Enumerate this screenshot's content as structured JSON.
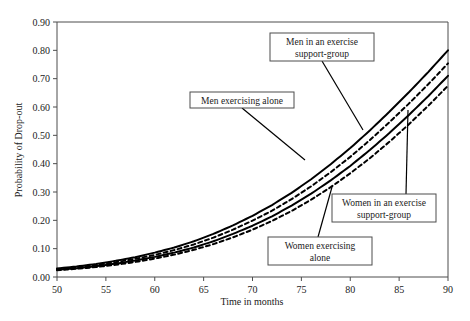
{
  "chart_data": {
    "type": "line",
    "title": "",
    "xlabel": "Time in months",
    "ylabel": "Probability of Drop-out",
    "xlim": [
      50,
      90
    ],
    "ylim": [
      0.0,
      0.9
    ],
    "xticks": [
      "50",
      "55",
      "60",
      "65",
      "70",
      "75",
      "80",
      "85",
      "90"
    ],
    "xtick_values": [
      50,
      55,
      60,
      65,
      70,
      75,
      80,
      85,
      90
    ],
    "yticks": [
      "0.00",
      "0.10",
      "0.20",
      "0.30",
      "0.40",
      "0.50",
      "0.60",
      "0.70",
      "0.80",
      "0.90"
    ],
    "ytick_values": [
      0.0,
      0.1,
      0.2,
      0.3,
      0.4,
      0.5,
      0.6,
      0.7,
      0.8,
      0.9
    ],
    "grid": false,
    "legend": "annotated-callouts",
    "x": [
      50,
      52,
      54,
      56,
      58,
      60,
      62,
      64,
      66,
      68,
      70,
      72,
      74,
      76,
      78,
      80,
      82,
      84,
      86,
      88,
      90
    ],
    "series": [
      {
        "name": "Men in an exercise support-group",
        "style": "solid",
        "color": "#000000",
        "values": [
          0.03,
          0.037,
          0.046,
          0.057,
          0.07,
          0.086,
          0.104,
          0.126,
          0.152,
          0.182,
          0.216,
          0.254,
          0.297,
          0.345,
          0.398,
          0.455,
          0.517,
          0.583,
          0.652,
          0.724,
          0.8
        ]
      },
      {
        "name": "Men exercising alone",
        "style": "dashed",
        "color": "#000000",
        "values": [
          0.028,
          0.034,
          0.042,
          0.052,
          0.064,
          0.078,
          0.095,
          0.115,
          0.139,
          0.167,
          0.199,
          0.234,
          0.275,
          0.32,
          0.37,
          0.424,
          0.483,
          0.546,
          0.612,
          0.681,
          0.754
        ]
      },
      {
        "name": "Women in an exercise support-group",
        "style": "solid",
        "color": "#000000",
        "values": [
          0.026,
          0.031,
          0.038,
          0.047,
          0.058,
          0.071,
          0.086,
          0.104,
          0.126,
          0.152,
          0.181,
          0.214,
          0.252,
          0.294,
          0.341,
          0.392,
          0.448,
          0.508,
          0.572,
          0.639,
          0.71
        ]
      },
      {
        "name": "Women exercising alone",
        "style": "dashed",
        "color": "#000000",
        "values": [
          0.024,
          0.029,
          0.035,
          0.043,
          0.053,
          0.065,
          0.079,
          0.096,
          0.116,
          0.14,
          0.167,
          0.198,
          0.233,
          0.273,
          0.317,
          0.366,
          0.419,
          0.477,
          0.539,
          0.605,
          0.675
        ]
      }
    ],
    "annotations": [
      {
        "id": "men-support-group",
        "line1": "Men in an exercise",
        "line2": "support-group",
        "box": {
          "x": 270,
          "y": 33,
          "w": 104,
          "h": 28
        },
        "leader": {
          "x1": 322,
          "y1": 61,
          "x2": 363,
          "y2": 130
        }
      },
      {
        "id": "men-alone",
        "line1": "Men exercising alone",
        "line2": "",
        "box": {
          "x": 190,
          "y": 92,
          "w": 104,
          "h": 16
        },
        "leader": {
          "x1": 242,
          "y1": 108,
          "x2": 305,
          "y2": 160
        }
      },
      {
        "id": "women-support-group",
        "line1": "Women in an exercise",
        "line2": "support-group",
        "box": {
          "x": 332,
          "y": 194,
          "w": 104,
          "h": 28
        },
        "leader": {
          "x1": 406,
          "y1": 194,
          "x2": 408,
          "y2": 110
        }
      },
      {
        "id": "women-alone",
        "line1": "Women exercising",
        "line2": "alone",
        "box": {
          "x": 268,
          "y": 237,
          "w": 104,
          "h": 28
        },
        "leader": {
          "x1": 318,
          "y1": 237,
          "x2": 332,
          "y2": 187
        }
      }
    ]
  }
}
